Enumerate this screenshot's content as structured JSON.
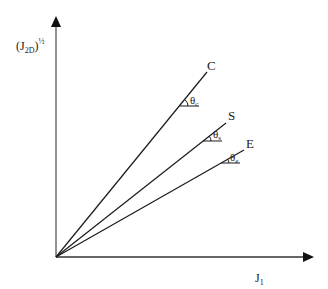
{
  "diagram": {
    "y_axis": {
      "label_main": "(J",
      "label_sub": "2D",
      "label_close": ")",
      "label_sup": "½"
    },
    "x_axis": {
      "label_main": "J",
      "label_sub": "1"
    },
    "lines": [
      {
        "id": "C",
        "label": "C",
        "angle_symbol": "θ",
        "angle_sub": "c"
      },
      {
        "id": "S",
        "label": "S",
        "angle_symbol": "θ",
        "angle_sub": "s"
      },
      {
        "id": "E",
        "label": "E",
        "angle_symbol": "θ",
        "angle_sub": "e"
      }
    ],
    "colors": {
      "stroke": "#1a1a1a",
      "axis": "#333333",
      "background": "#ffffff"
    }
  }
}
